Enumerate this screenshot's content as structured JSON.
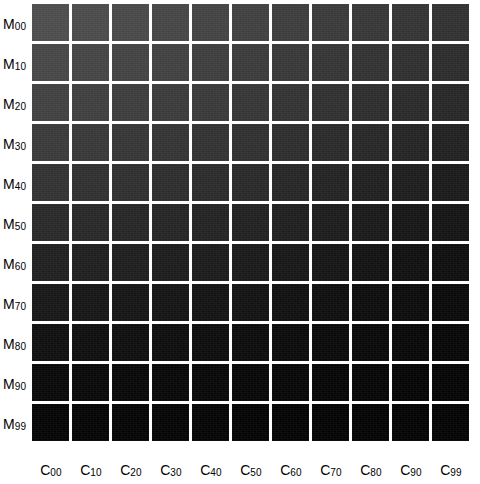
{
  "figure": {
    "type": "heatmap-grid",
    "background_color": "#ffffff",
    "gap_color": "#ffffff",
    "label_color": "#000000",
    "rows": 11,
    "cols": 11
  },
  "row_labels": [
    {
      "base": "M",
      "sub": "00"
    },
    {
      "base": "M",
      "sub": "10"
    },
    {
      "base": "M",
      "sub": "20"
    },
    {
      "base": "M",
      "sub": "30"
    },
    {
      "base": "M",
      "sub": "40"
    },
    {
      "base": "M",
      "sub": "50"
    },
    {
      "base": "M",
      "sub": "60"
    },
    {
      "base": "M",
      "sub": "70"
    },
    {
      "base": "M",
      "sub": "80"
    },
    {
      "base": "M",
      "sub": "90"
    },
    {
      "base": "M",
      "sub": "99"
    }
  ],
  "col_labels": [
    {
      "base": "C",
      "sub": "00"
    },
    {
      "base": "C",
      "sub": "10"
    },
    {
      "base": "C",
      "sub": "20"
    },
    {
      "base": "C",
      "sub": "30"
    },
    {
      "base": "C",
      "sub": "40"
    },
    {
      "base": "C",
      "sub": "50"
    },
    {
      "base": "C",
      "sub": "60"
    },
    {
      "base": "C",
      "sub": "70"
    },
    {
      "base": "C",
      "sub": "80"
    },
    {
      "base": "C",
      "sub": "90"
    },
    {
      "base": "C",
      "sub": "99"
    }
  ],
  "chart_data": {
    "type": "heatmap",
    "title": "",
    "xlabel": "",
    "ylabel": "",
    "grid": false,
    "legend": "none",
    "colormap": "grayscale",
    "value_units": "gray-level (0-255)",
    "categories_x": [
      "C00",
      "C10",
      "C20",
      "C30",
      "C40",
      "C50",
      "C60",
      "C70",
      "C80",
      "C90",
      "C99"
    ],
    "categories_y": [
      "M00",
      "M10",
      "M20",
      "M30",
      "M40",
      "M50",
      "M60",
      "M70",
      "M80",
      "M90",
      "M99"
    ],
    "zlim": [
      0,
      74
    ],
    "values": [
      [
        74,
        72,
        70,
        67,
        64,
        61,
        58,
        55,
        52,
        49,
        46
      ],
      [
        68,
        66,
        64,
        62,
        59,
        56,
        53,
        50,
        47,
        44,
        41
      ],
      [
        62,
        60,
        58,
        56,
        54,
        51,
        48,
        45,
        42,
        39,
        36
      ],
      [
        55,
        53,
        51,
        49,
        47,
        45,
        42,
        39,
        36,
        33,
        30
      ],
      [
        47,
        45,
        44,
        42,
        40,
        38,
        35,
        32,
        29,
        26,
        23
      ],
      [
        38,
        37,
        35,
        34,
        32,
        30,
        28,
        25,
        22,
        19,
        17
      ],
      [
        29,
        28,
        27,
        25,
        24,
        22,
        20,
        18,
        15,
        13,
        11
      ],
      [
        20,
        19,
        18,
        17,
        16,
        15,
        13,
        11,
        9,
        8,
        6
      ],
      [
        12,
        11,
        11,
        10,
        9,
        8,
        7,
        6,
        5,
        4,
        3
      ],
      [
        5,
        5,
        4,
        4,
        4,
        3,
        3,
        2,
        2,
        1,
        1
      ],
      [
        1,
        1,
        1,
        1,
        1,
        0,
        0,
        0,
        0,
        0,
        0
      ]
    ]
  },
  "layout": {
    "cell_size": 37,
    "cell_pitch": 40,
    "grid_left": 32,
    "grid_top": 4
  }
}
